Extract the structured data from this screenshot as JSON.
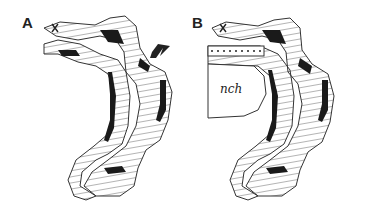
{
  "figure": {
    "panels": [
      {
        "label": "A",
        "has_arrow": true,
        "structures": [
          "outer folded epithelium",
          "inner folded epithelium",
          "dark basal layer"
        ]
      },
      {
        "label": "B",
        "has_arrow": false,
        "structures": [
          "outer folded epithelium",
          "inner folded epithelium",
          "dotted cell row",
          "notochord",
          "dark basal layer"
        ],
        "notochord_label": "nch"
      }
    ],
    "colors": {
      "line": "#333333",
      "fill_dark": "#1a1a1a",
      "background": "#ffffff"
    }
  }
}
